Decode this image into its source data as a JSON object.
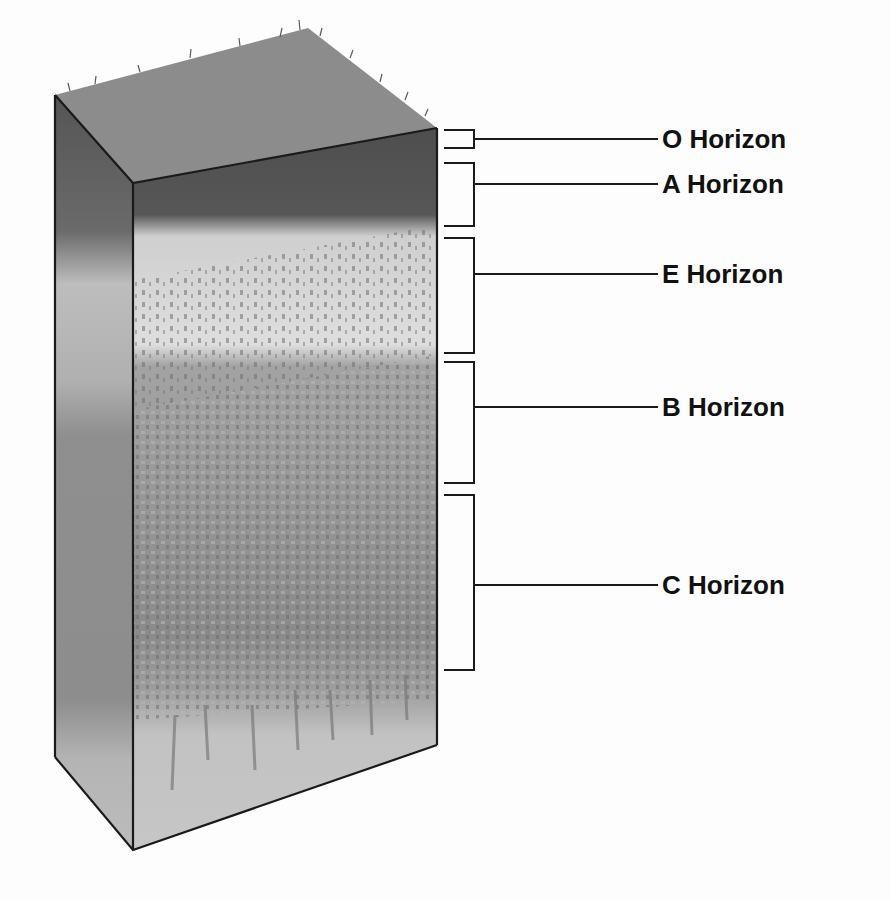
{
  "horizons": [
    {
      "id": "O",
      "label": "O Horizon",
      "bracket_top": 130,
      "bracket_bottom": 148,
      "label_y": 130
    },
    {
      "id": "A",
      "label": "A Horizon",
      "bracket_top": 163,
      "bracket_bottom": 226,
      "label_y": 174
    },
    {
      "id": "E",
      "label": "E Horizon",
      "bracket_top": 238,
      "bracket_bottom": 353,
      "label_y": 264
    },
    {
      "id": "B",
      "label": "B Horizon",
      "bracket_top": 362,
      "bracket_bottom": 483,
      "label_y": 398
    },
    {
      "id": "C",
      "label": "C Horizon",
      "bracket_top": 495,
      "bracket_bottom": 670,
      "label_y": 576
    }
  ],
  "colors": {
    "top_surface": "#8a8a8a",
    "o_a_layer": "#595959",
    "e_layer": "#dcdcdc",
    "b_layer": "#9a9a9a",
    "c_layer": "#8c8c8c",
    "bedrock": "#c4c4c4",
    "outline": "#1a1a1a",
    "label_text": "#111111"
  }
}
